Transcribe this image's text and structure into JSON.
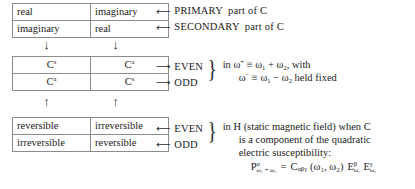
{
  "diagram": {
    "tables": {
      "complex_parts": {
        "rows": [
          [
            "real",
            "imaginary"
          ],
          [
            "imaginary",
            "real"
          ]
        ]
      },
      "c_symmetry": {
        "rows": [
          [
            {
              "base": "C",
              "sup": "s"
            },
            {
              "base": "C",
              "sup": "a"
            }
          ],
          [
            {
              "base": "C",
              "sup": "a"
            },
            {
              "base": "C",
              "sup": "s"
            }
          ]
        ]
      },
      "reversibility": {
        "rows": [
          [
            "reversible",
            "irreversible"
          ],
          [
            "irreversible",
            "reversible"
          ]
        ]
      }
    },
    "connectors": {
      "down_arrows": [
        "↓",
        "↓"
      ],
      "up_arrows": [
        "↑",
        "↑"
      ]
    },
    "annotations": {
      "primary": {
        "arrow": "⟵",
        "label": "PRIMARY",
        "tail": "part of C"
      },
      "secondary": {
        "arrow": "⟵",
        "label": "SECONDARY",
        "tail": "part of C"
      },
      "parity_top": {
        "arrow": "⟶",
        "even": "EVEN",
        "odd": "ODD",
        "brace": "}",
        "condition_line1_pre": "in ω",
        "condition_line1_sup": "+",
        "condition_line1_post": " ≡ ω",
        "condition_line1_sub1": "1",
        "condition_line1_mid": " + ω",
        "condition_line1_sub2": "2",
        "condition_line1_end": ", with",
        "condition_line2_pre": "ω",
        "condition_line2_sup": "−",
        "condition_line2_post": " ≡ ω",
        "condition_line2_sub1": "1",
        "condition_line2_mid": " − ω",
        "condition_line2_sub2": "2",
        "condition_line2_end": " held fixed"
      },
      "parity_bottom": {
        "arrow": "⟵",
        "even": "EVEN",
        "odd": "ODD",
        "brace": "}",
        "line1": "in H (static magnetic field) when C",
        "line2": "is a component of the quadratic",
        "line3": "electric susceptibility:",
        "formula": {
          "p_base": "P",
          "p_sup": "α",
          "p_sub": "ω₁ + ω₂",
          "equals": "=",
          "c_base": "C",
          "c_sub": "αβγ",
          "args": "(ω₁, ω₂)",
          "e1_base": "E",
          "e1_sup": "β",
          "e1_sub": "ω₁",
          "e2_base": "E",
          "e2_sup": "γ",
          "e2_sub": "ω₂"
        }
      }
    }
  },
  "colors": {
    "text": "#1b1b1b",
    "border": "#8c8c8c",
    "background": "#ffffff"
  }
}
